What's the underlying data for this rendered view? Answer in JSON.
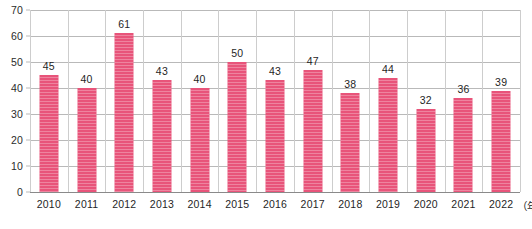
{
  "chart_data": {
    "type": "bar",
    "title": "",
    "subtitle": "",
    "xlabel": "（年）",
    "ylabel": "",
    "categories": [
      "2010",
      "2011",
      "2012",
      "2013",
      "2014",
      "2015",
      "2016",
      "2017",
      "2018",
      "2019",
      "2020",
      "2021",
      "2022"
    ],
    "values": [
      45,
      40,
      61,
      43,
      40,
      50,
      43,
      47,
      38,
      44,
      32,
      36,
      39
    ],
    "ylim": [
      0,
      70
    ],
    "ytick_values": [
      0,
      10,
      20,
      30,
      40,
      50,
      60,
      70
    ],
    "ytick_labels": [
      "0",
      "10",
      "20",
      "30",
      "40",
      "50",
      "60",
      "70"
    ],
    "grid": true,
    "grid_orientation": "both",
    "legend": false,
    "legend_position": "none",
    "data_labels": true,
    "series": [
      {
        "name": "",
        "values": [
          45,
          40,
          61,
          43,
          40,
          50,
          43,
          47,
          38,
          44,
          32,
          36,
          39
        ],
        "color": "#e8547a"
      }
    ]
  },
  "colors": {
    "bar": "#e8547a",
    "bar_stripe": "#f4869f",
    "gridline": "#b9b9b9",
    "vertical_separator": "#cdcdcd",
    "baseline": "#8a8a8a",
    "text": "#1f1f1f",
    "background": "#ffffff"
  },
  "axis": {
    "x_unit": "（年）",
    "y_max_label": "70",
    "y_min_label": "0"
  }
}
